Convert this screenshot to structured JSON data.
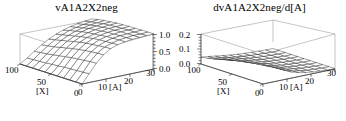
{
  "figure": {
    "background_color": "#ffffff",
    "panel_count": 2
  },
  "panels": [
    {
      "id": "vA1A2X2neg",
      "title": "vA1A2X2neg",
      "x_axis_label": "[A]",
      "y_axis_label": "[X]",
      "x_ticks": [
        "0",
        "10",
        "20",
        "30"
      ],
      "y_ticks": [
        "0",
        "50",
        "100"
      ],
      "z_ticks": [
        "0.0",
        "0.5",
        "1.0"
      ],
      "z_axis_side": "right"
    },
    {
      "id": "dvA1A2X2neg-dA",
      "title": "dvA1A2X2neg/d[A]",
      "x_axis_label": "[A]",
      "y_axis_label": "[X]",
      "x_ticks": [
        "0",
        "10",
        "20",
        "30"
      ],
      "y_ticks": [
        "0",
        "50",
        "100"
      ],
      "z_ticks": [
        "0.0",
        "0.1",
        "0.2"
      ],
      "z_axis_side": "left"
    }
  ],
  "chart_data": [
    {
      "type": "surface",
      "title": "vA1A2X2neg",
      "xlabel": "[A]",
      "ylabel": "[X]",
      "zlabel": "",
      "xlim": [
        0,
        30
      ],
      "ylim": [
        0,
        100
      ],
      "zlim": [
        0.0,
        1.0
      ],
      "xticks": [
        0,
        10,
        20,
        30
      ],
      "yticks": [
        0,
        50,
        100
      ],
      "zticks": [
        0.0,
        0.5,
        1.0
      ],
      "grid": true,
      "legend": "none",
      "mesh": "wireframe",
      "x": [
        0,
        3,
        6,
        9,
        12,
        15,
        18,
        21,
        24,
        27,
        30
      ],
      "y": [
        0,
        10,
        20,
        30,
        40,
        50,
        60,
        70,
        80,
        90,
        100
      ],
      "z": [
        [
          0.0,
          0.13,
          0.28,
          0.42,
          0.54,
          0.64,
          0.71,
          0.77,
          0.81,
          0.84,
          0.86
        ],
        [
          0.0,
          0.14,
          0.3,
          0.45,
          0.58,
          0.68,
          0.76,
          0.81,
          0.85,
          0.88,
          0.9
        ],
        [
          0.0,
          0.15,
          0.32,
          0.48,
          0.62,
          0.72,
          0.8,
          0.85,
          0.89,
          0.91,
          0.93
        ],
        [
          0.0,
          0.16,
          0.35,
          0.52,
          0.66,
          0.76,
          0.84,
          0.89,
          0.92,
          0.94,
          0.95
        ],
        [
          0.0,
          0.18,
          0.38,
          0.56,
          0.7,
          0.8,
          0.87,
          0.91,
          0.94,
          0.96,
          0.97
        ],
        [
          0.0,
          0.19,
          0.41,
          0.6,
          0.74,
          0.83,
          0.89,
          0.93,
          0.96,
          0.97,
          0.98
        ],
        [
          0.0,
          0.21,
          0.44,
          0.63,
          0.77,
          0.86,
          0.91,
          0.95,
          0.97,
          0.98,
          0.99
        ],
        [
          0.0,
          0.22,
          0.46,
          0.66,
          0.79,
          0.88,
          0.93,
          0.96,
          0.98,
          0.99,
          0.99
        ],
        [
          0.0,
          0.23,
          0.48,
          0.68,
          0.81,
          0.89,
          0.94,
          0.97,
          0.98,
          0.99,
          1.0
        ],
        [
          0.0,
          0.24,
          0.5,
          0.7,
          0.83,
          0.9,
          0.95,
          0.97,
          0.99,
          0.99,
          1.0
        ],
        [
          0.0,
          0.25,
          0.51,
          0.71,
          0.84,
          0.91,
          0.95,
          0.98,
          0.99,
          1.0,
          1.0
        ]
      ],
      "description": "Saturating sigmoid surface rising from 0 along the [A]=0 edge to a plateau near 1.0 at high [A]; mild increase with [X]."
    },
    {
      "type": "surface",
      "title": "dvA1A2X2neg/d[A]",
      "xlabel": "[A]",
      "ylabel": "[X]",
      "zlabel": "",
      "xlim": [
        0,
        30
      ],
      "ylim": [
        0,
        100
      ],
      "zlim": [
        0.0,
        0.2
      ],
      "xticks": [
        0,
        10,
        20,
        30
      ],
      "yticks": [
        0,
        50,
        100
      ],
      "zticks": [
        0.0,
        0.1,
        0.2
      ],
      "grid": true,
      "legend": "none",
      "mesh": "wireframe",
      "x": [
        0,
        3,
        6,
        9,
        12,
        15,
        18,
        21,
        24,
        27,
        30
      ],
      "y": [
        0,
        10,
        20,
        30,
        40,
        50,
        60,
        70,
        80,
        90,
        100
      ],
      "z": [
        [
          0.046,
          0.04,
          0.033,
          0.026,
          0.02,
          0.015,
          0.011,
          0.008,
          0.006,
          0.004,
          0.003
        ],
        [
          0.052,
          0.044,
          0.036,
          0.028,
          0.021,
          0.016,
          0.011,
          0.008,
          0.006,
          0.004,
          0.003
        ],
        [
          0.06,
          0.05,
          0.04,
          0.031,
          0.023,
          0.017,
          0.012,
          0.008,
          0.006,
          0.004,
          0.003
        ],
        [
          0.071,
          0.058,
          0.045,
          0.034,
          0.025,
          0.018,
          0.012,
          0.009,
          0.006,
          0.004,
          0.003
        ],
        [
          0.085,
          0.068,
          0.052,
          0.038,
          0.027,
          0.019,
          0.013,
          0.009,
          0.006,
          0.004,
          0.003
        ],
        [
          0.103,
          0.08,
          0.059,
          0.042,
          0.03,
          0.02,
          0.014,
          0.009,
          0.006,
          0.004,
          0.003
        ],
        [
          0.126,
          0.094,
          0.068,
          0.047,
          0.032,
          0.022,
          0.014,
          0.01,
          0.006,
          0.004,
          0.003
        ],
        [
          0.152,
          0.11,
          0.077,
          0.052,
          0.035,
          0.023,
          0.015,
          0.01,
          0.007,
          0.004,
          0.003
        ],
        [
          0.176,
          0.124,
          0.085,
          0.057,
          0.037,
          0.024,
          0.016,
          0.01,
          0.007,
          0.004,
          0.003
        ],
        [
          0.194,
          0.135,
          0.091,
          0.06,
          0.039,
          0.025,
          0.016,
          0.01,
          0.007,
          0.004,
          0.003
        ],
        [
          0.2,
          0.139,
          0.093,
          0.061,
          0.04,
          0.026,
          0.017,
          0.011,
          0.007,
          0.004,
          0.003
        ]
      ],
      "description": "Derivative surface: near-zero flat sheet over most of the domain with a sharp spike rising to about 0.2 at the [A]=0, [X]=100 corner."
    }
  ]
}
